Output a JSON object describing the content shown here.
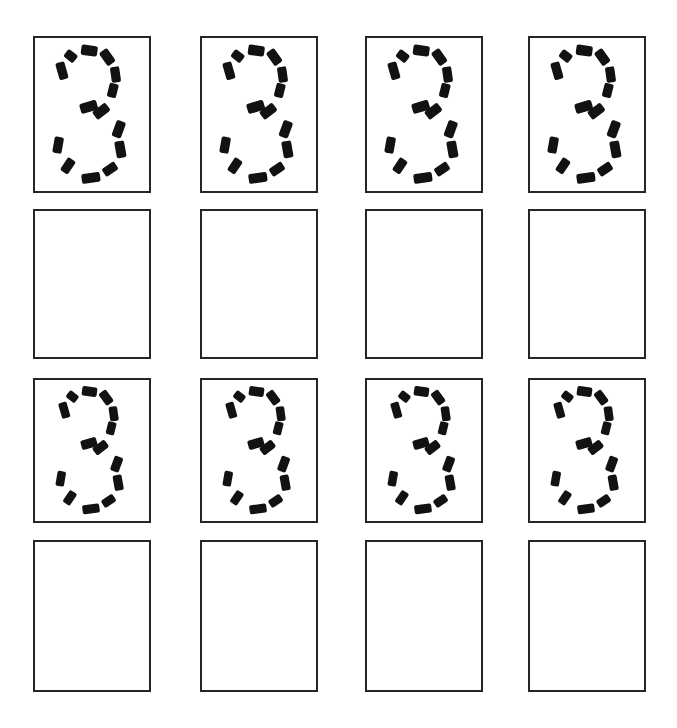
{
  "worksheet": {
    "title": "Number 3 Tracing Practice Worksheet",
    "page_width": 677,
    "page_height": 728,
    "background_color": "#ffffff",
    "border_color": "#262626",
    "trace_color": "#121212",
    "border_width_px": 2,
    "traced_character": "3",
    "grid": {
      "columns": 4,
      "rows": 4,
      "column_x": [
        33,
        200,
        365,
        528
      ],
      "row_y": [
        36,
        209,
        378,
        540
      ],
      "box_width": 118,
      "box_height": 157,
      "row_heights": [
        157,
        150,
        145,
        152
      ]
    },
    "rows": [
      {
        "index": 0,
        "type": "traced",
        "label": "traced-row-1",
        "cells": [
          {
            "index": 0,
            "content": "3",
            "style": "dashed-outline",
            "filled": true
          },
          {
            "index": 1,
            "content": "3",
            "style": "dashed-outline",
            "filled": true
          },
          {
            "index": 2,
            "content": "3",
            "style": "dashed-outline",
            "filled": true
          },
          {
            "index": 3,
            "content": "3",
            "style": "dashed-outline",
            "filled": true
          }
        ]
      },
      {
        "index": 1,
        "type": "blank",
        "label": "blank-row-1",
        "cells": [
          {
            "index": 0,
            "content": "",
            "style": "empty",
            "filled": false
          },
          {
            "index": 1,
            "content": "",
            "style": "empty",
            "filled": false
          },
          {
            "index": 2,
            "content": "",
            "style": "empty",
            "filled": false
          },
          {
            "index": 3,
            "content": "",
            "style": "empty",
            "filled": false
          }
        ]
      },
      {
        "index": 2,
        "type": "traced",
        "label": "traced-row-2",
        "cells": [
          {
            "index": 0,
            "content": "3",
            "style": "dashed-outline",
            "filled": true
          },
          {
            "index": 1,
            "content": "3",
            "style": "dashed-outline",
            "filled": true
          },
          {
            "index": 2,
            "content": "3",
            "style": "dashed-outline",
            "filled": true
          },
          {
            "index": 3,
            "content": "3",
            "style": "dashed-outline",
            "filled": true
          }
        ]
      },
      {
        "index": 3,
        "type": "blank",
        "label": "blank-row-2",
        "cells": [
          {
            "index": 0,
            "content": "",
            "style": "empty",
            "filled": false
          },
          {
            "index": 1,
            "content": "",
            "style": "empty",
            "filled": false
          },
          {
            "index": 2,
            "content": "",
            "style": "empty",
            "filled": false
          },
          {
            "index": 3,
            "content": "",
            "style": "empty",
            "filled": false
          }
        ]
      }
    ],
    "glyph_dashes": {
      "description": "Dash segments forming the outline of the numeral 3, in a 100x140 viewBox",
      "segments": [
        {
          "id": "top-left-tip",
          "cx": 30.5,
          "cy": 16.5,
          "w": 8.5,
          "h": 11.0,
          "rot": -52
        },
        {
          "id": "top-center",
          "cx": 47.5,
          "cy": 11.5,
          "w": 9.5,
          "h": 15.0,
          "rot": -82
        },
        {
          "id": "top-right",
          "cx": 64.0,
          "cy": 17.5,
          "w": 9.0,
          "h": 14.5,
          "rot": -36
        },
        {
          "id": "upper-left-arc",
          "cx": 22.5,
          "cy": 30.0,
          "w": 8.5,
          "h": 16.0,
          "rot": -16
        },
        {
          "id": "upper-right-arc",
          "cx": 71.5,
          "cy": 33.5,
          "w": 8.5,
          "h": 14.5,
          "rot": -8
        },
        {
          "id": "mid-right",
          "cx": 69.0,
          "cy": 48.0,
          "w": 8.5,
          "h": 13.0,
          "rot": 14
        },
        {
          "id": "waist-left",
          "cx": 47.0,
          "cy": 63.0,
          "w": 9.5,
          "h": 16.0,
          "rot": 74
        },
        {
          "id": "waist-right",
          "cx": 58.5,
          "cy": 67.0,
          "w": 9.0,
          "h": 15.0,
          "rot": 52
        },
        {
          "id": "lower-right-a",
          "cx": 74.5,
          "cy": 83.5,
          "w": 9.0,
          "h": 15.5,
          "rot": 20
        },
        {
          "id": "lower-right-b",
          "cx": 76.0,
          "cy": 102.0,
          "w": 9.0,
          "h": 15.5,
          "rot": -10
        },
        {
          "id": "lower-left-a",
          "cx": 19.0,
          "cy": 98.0,
          "w": 8.5,
          "h": 15.0,
          "rot": 10
        },
        {
          "id": "lower-left-b",
          "cx": 28.0,
          "cy": 117.0,
          "w": 8.5,
          "h": 14.0,
          "rot": 34
        },
        {
          "id": "bottom-center",
          "cx": 49.0,
          "cy": 128.0,
          "w": 9.0,
          "h": 17.0,
          "rot": 82
        },
        {
          "id": "bottom-right",
          "cx": 66.5,
          "cy": 120.0,
          "w": 8.5,
          "h": 13.5,
          "rot": 56
        }
      ]
    }
  }
}
